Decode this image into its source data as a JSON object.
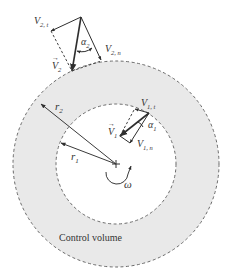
{
  "diagram": {
    "type": "turbomachine control volume velocity triangles",
    "colors": {
      "annulus_fill": "#e9e9e9",
      "line": "#3a3a3a",
      "dash": "#666666",
      "background": "#ffffff"
    },
    "geometry": {
      "center": [
        116,
        164
      ],
      "outer_radius": 103,
      "inner_radius": 60
    },
    "labels": {
      "control_volume": "Control volume",
      "omega": "ω",
      "r1": "r",
      "r1_sub": "1",
      "r2": "r",
      "r2_sub": "2",
      "V1_vec": "V",
      "V1_vec_sub": "1",
      "V1t": "V",
      "V1t_sub": "1, t",
      "V1n": "V",
      "V1n_sub": "1, n",
      "alpha1": "α",
      "alpha1_sub": "1",
      "V2_vec": "V",
      "V2_vec_sub": "2",
      "V2t": "V",
      "V2t_sub": "2, t",
      "V2n": "V",
      "V2n_sub": "2, n",
      "alpha2": "α",
      "alpha2_sub": "2",
      "vec_arrow": "→"
    }
  }
}
